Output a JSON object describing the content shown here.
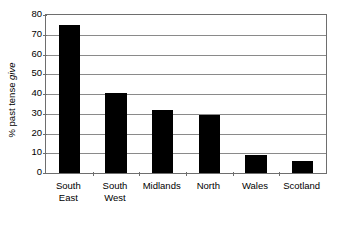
{
  "chart_data": {
    "type": "bar",
    "title": "",
    "subtitle": "",
    "xlabel": "",
    "ylabel_prefix": "% past tense ",
    "ylabel_italic": "give",
    "ylabel": "% past tense give",
    "categories": [
      "South East",
      "South West",
      "Midlands",
      "North",
      "Wales",
      "Scotland"
    ],
    "category_lines": [
      [
        "South",
        "East"
      ],
      [
        "South",
        "West"
      ],
      [
        "Midlands"
      ],
      [
        "North"
      ],
      [
        "Wales"
      ],
      [
        "Scotland"
      ]
    ],
    "values": [
      75,
      40.5,
      32,
      29.5,
      9,
      6
    ],
    "ylim": [
      0,
      80
    ],
    "ytick_step": 10,
    "yticks": [
      80,
      70,
      60,
      50,
      40,
      30,
      20,
      10,
      0
    ],
    "ytick_labels": [
      "80",
      "70",
      "60",
      "50",
      "40",
      "30",
      "20",
      "10",
      "0"
    ],
    "grid": true,
    "grid_axis": "y",
    "legend": false,
    "legend_position": "none",
    "bar_color": "#000000",
    "grid_color": "#8a8a8a",
    "frame_color": "#6e6e6e",
    "background_color": "#ffffff"
  }
}
